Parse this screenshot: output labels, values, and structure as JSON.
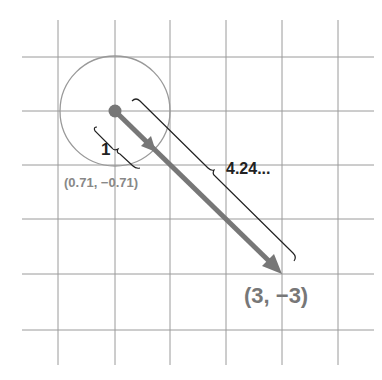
{
  "diagram": {
    "type": "vector-normalization",
    "grid": {
      "color": "#999999",
      "spacing_px": 54.5
    },
    "vector": {
      "from": [
        0,
        0
      ],
      "to": [
        3,
        -3
      ],
      "color": "#777777"
    },
    "unit_vector": {
      "to": [
        0.71,
        -0.71
      ]
    },
    "unit_circle": {
      "radius": 1,
      "color": "#999999"
    },
    "labels": {
      "unit_length": "1",
      "unit_coords": "(0.71, −0.71)",
      "vector_length": "4.24...",
      "endpoint": "(3, −3)"
    }
  }
}
